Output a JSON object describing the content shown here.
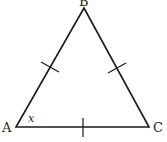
{
  "diagram": {
    "type": "equilateral-triangle",
    "vertices": {
      "A": {
        "label": "A",
        "x": 16,
        "y": 127
      },
      "B": {
        "label": "B",
        "x": 84,
        "y": 8
      },
      "C": {
        "label": "C",
        "x": 149,
        "y": 127
      }
    },
    "angle_label": "x",
    "angle_at": "A",
    "equal_side_ticks": 3,
    "stroke_color": "#1a1a1a"
  }
}
